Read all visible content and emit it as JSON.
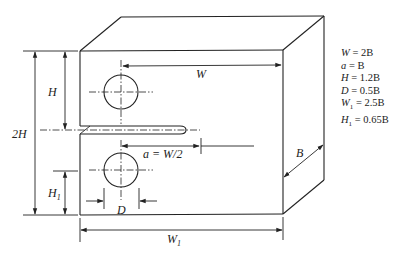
{
  "diagram": {
    "type": "compact tension specimen",
    "labels": {
      "width": "W",
      "width_total": "W",
      "width_total_sub": "1",
      "height": "H",
      "double_height": "2H",
      "height1": "H",
      "height1_sub": "1",
      "crack_length": "a = W/2",
      "hole_diameter": "D",
      "thickness": "B"
    },
    "equations": [
      {
        "lhs": "W",
        "sub": "",
        "rhs": " = 2B"
      },
      {
        "lhs": "a",
        "sub": "",
        "rhs": " = B"
      },
      {
        "lhs": "H",
        "sub": "",
        "rhs": " = 1.2B"
      },
      {
        "lhs": "D",
        "sub": "",
        "rhs": " = 0.5B"
      },
      {
        "lhs": "W",
        "sub": "1",
        "rhs": " = 2.5B"
      },
      {
        "lhs": "H",
        "sub": "1",
        "rhs": " = 0.65B"
      }
    ]
  }
}
